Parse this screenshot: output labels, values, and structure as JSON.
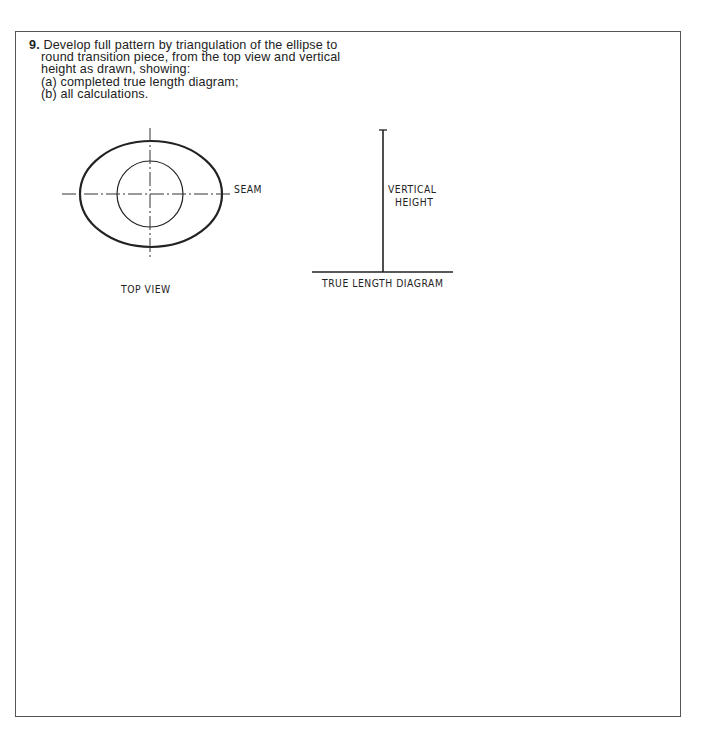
{
  "question": {
    "number": "9.",
    "lines": [
      "Develop full pattern by triangulation of the ellipse to",
      "round transition piece, from the top view and vertical",
      "height as drawn, showing:",
      "(a) completed true length diagram;",
      "(b) all calculations."
    ]
  },
  "top_view": {
    "seam_label": "SEAM",
    "caption": "TOP VIEW"
  },
  "true_length_diagram": {
    "height_label_line1": "VERTICAL",
    "height_label_line2": "HEIGHT",
    "caption": "TRUE LENGTH DIAGRAM"
  }
}
